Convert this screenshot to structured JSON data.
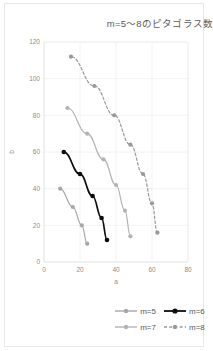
{
  "chart_data": {
    "type": "scatter",
    "title": "m=5〜8のピタゴラス数",
    "xlabel": "a",
    "ylabel": "b",
    "xlim": [
      0,
      80
    ],
    "ylim": [
      0,
      120
    ],
    "xticks": [
      "0",
      "20",
      "40",
      "60",
      "80"
    ],
    "yticks": [
      "0",
      "20",
      "40",
      "60",
      "80",
      "100",
      "120"
    ],
    "grid": true,
    "legend_position": "bottom",
    "series": [
      {
        "name": "m=5",
        "color": "#a6a6a6",
        "style": "solid",
        "points": [
          [
            24,
            10
          ],
          [
            21,
            20
          ],
          [
            16,
            30
          ],
          [
            9,
            40
          ]
        ]
      },
      {
        "name": "m=6",
        "color": "#0d0d0d",
        "style": "solid",
        "points": [
          [
            35,
            12
          ],
          [
            32,
            24
          ],
          [
            27,
            36
          ],
          [
            20,
            48
          ],
          [
            11,
            60
          ]
        ]
      },
      {
        "name": "m=7",
        "color": "#b3b3b3",
        "style": "solid",
        "points": [
          [
            48,
            14
          ],
          [
            45,
            28
          ],
          [
            40,
            42
          ],
          [
            33,
            56
          ],
          [
            24,
            70
          ],
          [
            13,
            84
          ]
        ]
      },
      {
        "name": "m=8",
        "color": "#999999",
        "style": "dashed",
        "points": [
          [
            63,
            16
          ],
          [
            60,
            32
          ],
          [
            55,
            48
          ],
          [
            48,
            64
          ],
          [
            39,
            80
          ],
          [
            28,
            96
          ],
          [
            15,
            112
          ]
        ]
      }
    ]
  },
  "legend": {
    "rows": [
      [
        {
          "label": "m=5",
          "color": "#a6a6a6",
          "style": "solid"
        },
        {
          "label": "m=6",
          "color": "#0d0d0d",
          "style": "solid"
        }
      ],
      [
        {
          "label": "m=7",
          "color": "#b3b3b3",
          "style": "solid"
        },
        {
          "label": "m=8",
          "color": "#999999",
          "style": "dashed"
        }
      ]
    ]
  },
  "colors": {
    "frame_border": "#e8e8e8",
    "grid": "#efefef",
    "tick_text": "#8c8c8c",
    "title_text": "#5a5a5a",
    "background": "#ffffff"
  }
}
